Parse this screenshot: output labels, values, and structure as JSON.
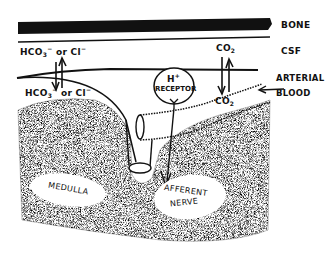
{
  "diagram": {
    "type": "physiology-schematic",
    "layers": [
      {
        "label": "BONE"
      },
      {
        "label": "CSF"
      },
      {
        "label": "ARTERIAL BLOOD"
      }
    ],
    "labels": {
      "bone": "BONE",
      "csf": "CSF",
      "arterial_blood_line1": "ARTERIAL",
      "arterial_blood_line2": "BLOOD",
      "hco3_top": "HCO",
      "hco3_top_sub": "3",
      "hco3_top_sup": "−",
      "or_top": " or Cl",
      "cl_top_sup": "−",
      "hco3_bottom": "HCO",
      "hco3_bottom_sub": "3",
      "hco3_bottom_sup": "−",
      "or_bottom": " or Cl",
      "cl_bottom_sup": "−",
      "co2_top": "CO",
      "co2_top_sub": "2",
      "co2_bottom": "CO",
      "co2_bottom_sub": "2",
      "receptor_h": "H",
      "receptor_h_sup": "+",
      "receptor": "RECEPTOR",
      "medulla": "MEDULLA",
      "afferent_line1": "AFFERENT",
      "afferent_line2": "NERVE"
    },
    "colors": {
      "ink": "#111111",
      "background": "#ffffff",
      "stipple": "#555555"
    }
  }
}
